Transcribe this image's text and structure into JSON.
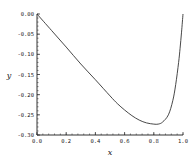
{
  "chart_data": {
    "type": "line",
    "title": "",
    "xlabel": "x",
    "ylabel": "y",
    "xlim": [
      0.0,
      1.0
    ],
    "ylim": [
      -0.3,
      0.0
    ],
    "xticks": [
      0.0,
      0.2,
      0.4,
      0.6,
      0.8,
      1.0
    ],
    "xtick_labels": [
      "0.0",
      "0.2",
      "0.4",
      "0.6",
      "0.8",
      "1.0"
    ],
    "yticks": [
      0.0,
      -0.05,
      -0.1,
      -0.15,
      -0.2,
      -0.25,
      -0.3
    ],
    "ytick_labels": [
      "0.00",
      "-0.05",
      "-0.10",
      "-0.15",
      "-0.20",
      "-0.25",
      "-0.30"
    ],
    "grid": false,
    "legend": "none",
    "series": [
      {
        "name": "y(x)",
        "color": "#333333",
        "x": [
          0.0,
          0.1,
          0.2,
          0.3,
          0.4,
          0.5,
          0.55,
          0.6,
          0.65,
          0.7,
          0.75,
          0.8,
          0.83,
          0.86,
          0.9,
          0.93,
          0.95,
          0.97,
          0.98,
          0.99,
          1.0
        ],
        "y": [
          0.0,
          -0.041,
          -0.082,
          -0.124,
          -0.163,
          -0.203,
          -0.222,
          -0.238,
          -0.252,
          -0.263,
          -0.27,
          -0.273,
          -0.273,
          -0.268,
          -0.25,
          -0.215,
          -0.175,
          -0.12,
          -0.085,
          -0.045,
          0.0
        ]
      }
    ]
  }
}
